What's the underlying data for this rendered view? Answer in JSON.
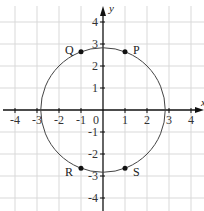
{
  "figure": {
    "corner_label": "",
    "axes": {
      "x_label": "x",
      "y_label": "y",
      "origin_label": "0",
      "x_ticks": [
        -4,
        -3,
        -2,
        -1,
        1,
        2,
        3,
        4
      ],
      "y_ticks": [
        4,
        3,
        2,
        1,
        -1,
        -2,
        -3,
        -4
      ],
      "range": [
        -4.5,
        4.5
      ]
    },
    "circle": {
      "center": [
        0,
        0
      ],
      "radius": 2.83
    },
    "points": [
      {
        "label": "P",
        "x": 1,
        "y": 2.65
      },
      {
        "label": "Q",
        "x": -1,
        "y": 2.65
      },
      {
        "label": "R",
        "x": -1,
        "y": -2.65
      },
      {
        "label": "S",
        "x": 1,
        "y": -2.65
      }
    ],
    "colors": {
      "grid": "#d9d9d9",
      "axis": "#111111",
      "circle": "#444444"
    }
  }
}
